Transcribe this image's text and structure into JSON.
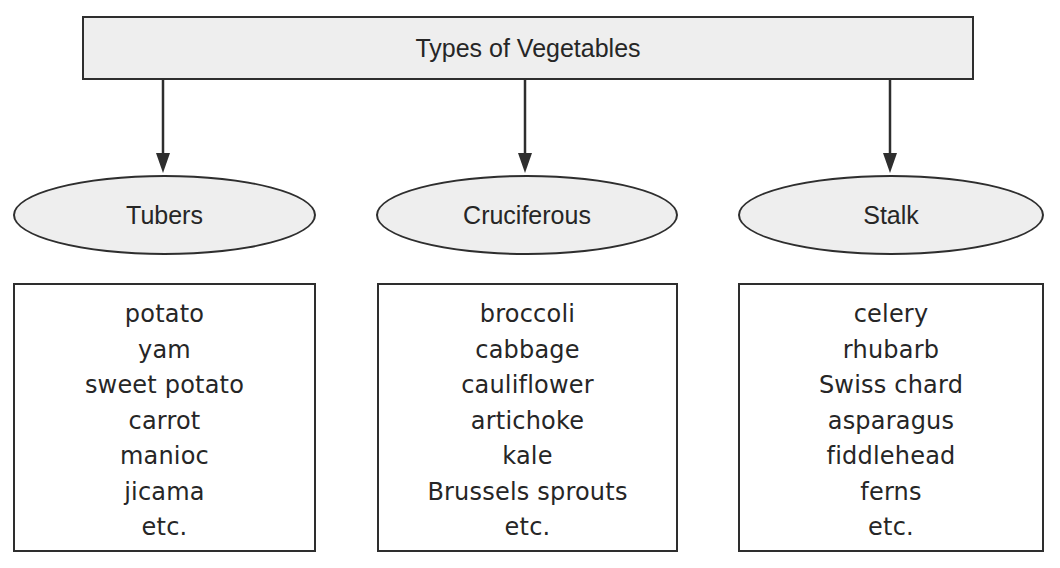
{
  "diagram": {
    "title": "Types of Vegetables",
    "categories": [
      {
        "label": "Tubers",
        "items": [
          "potato",
          "yam",
          "sweet potato",
          "carrot",
          "manioc",
          "jicama",
          "etc."
        ]
      },
      {
        "label": "Cruciferous",
        "items": [
          "broccoli",
          "cabbage",
          "cauliflower",
          "artichoke",
          "kale",
          "Brussels sprouts",
          "etc."
        ]
      },
      {
        "label": "Stalk",
        "items": [
          "celery",
          "rhubarb",
          "Swiss chard",
          "asparagus",
          "fiddlehead",
          "ferns",
          "etc."
        ]
      }
    ],
    "colors": {
      "node_fill": "#eeeeee",
      "stroke": "#2e2e2e",
      "text": "#262626"
    }
  }
}
